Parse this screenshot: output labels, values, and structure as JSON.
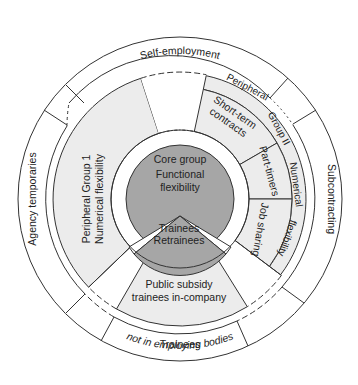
{
  "diagram": {
    "colors": {
      "line": "#333333",
      "core_fill": "#a6a6a6",
      "peripheral_fill": "#ececec",
      "background": "#ffffff"
    },
    "outer_ring": {
      "self_employment": "Self-employment",
      "subcontracting": "Subcontracting",
      "agency_temporaries": "Agency temporaries",
      "trainees_line1": "Trainees",
      "trainees_line2": "not in employing bodies"
    },
    "peripheral_group_1": {
      "line1": "Peripheral Group 1",
      "line2": "Numerical flexibility"
    },
    "peripheral_group_2": {
      "band_label_a": "Peripheral",
      "band_label_b": "Group II",
      "band_label_c": "Numerical",
      "band_label_d": "flexibility",
      "sectors": [
        {
          "line1": "Short-term",
          "line2": "contracts"
        },
        {
          "line1": "Part-timers"
        },
        {
          "line1": "Job sharing"
        }
      ]
    },
    "public_subsidy": {
      "line1": "Public subsidy",
      "line2": "trainees in-company"
    },
    "core": {
      "line1": "Core group",
      "line2": "Functional",
      "line3": "flexibility",
      "trainees_line1": "Trainees",
      "trainees_line2": "Retrainees"
    }
  }
}
